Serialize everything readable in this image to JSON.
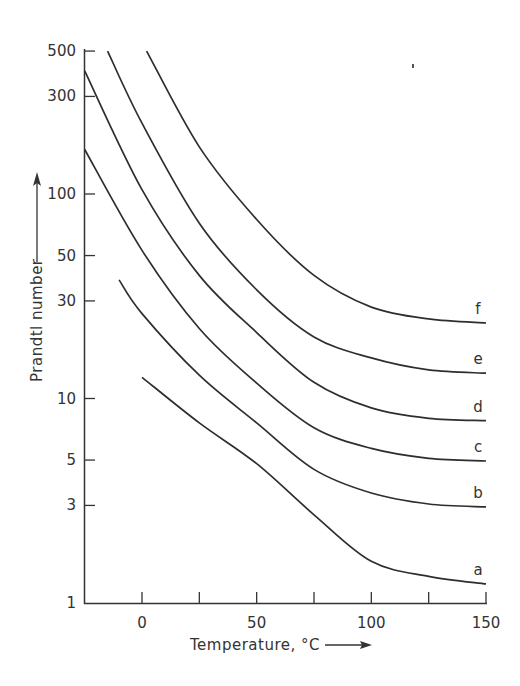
{
  "chart_data": {
    "type": "line",
    "title": "",
    "xlabel": "Temperature, °C",
    "ylabel": "Prandtl number",
    "x_scale": "linear",
    "y_scale": "log",
    "xlim": [
      -25,
      150
    ],
    "ylim": [
      1,
      500
    ],
    "x_ticks": [
      -25,
      0,
      25,
      50,
      75,
      100,
      125,
      150
    ],
    "x_tick_labels": [
      "0",
      "50",
      "100",
      "150"
    ],
    "x_tick_label_values": [
      0,
      50,
      100,
      150
    ],
    "y_ticks": [
      1,
      3,
      5,
      10,
      30,
      50,
      100,
      300,
      500
    ],
    "y_tick_labels": [
      "1",
      "3",
      "5",
      "10",
      "30",
      "50",
      "100",
      "300",
      "500"
    ],
    "grid": false,
    "legend": "inline labels at right end of curves",
    "series": [
      {
        "name": "a",
        "x": [
          0,
          25,
          50,
          75,
          100,
          125,
          150
        ],
        "values": [
          12.7,
          7.6,
          4.8,
          2.7,
          1.6,
          1.35,
          1.24
        ]
      },
      {
        "name": "b",
        "x": [
          -10,
          0,
          25,
          50,
          75,
          100,
          125,
          150
        ],
        "values": [
          38,
          26,
          13,
          7.6,
          4.5,
          3.45,
          3.05,
          2.95
        ]
      },
      {
        "name": "c",
        "x": [
          -25,
          0,
          25,
          50,
          75,
          100,
          125,
          150
        ],
        "values": [
          165,
          53,
          22,
          11.9,
          7.2,
          5.7,
          5.1,
          4.95
        ]
      },
      {
        "name": "d",
        "x": [
          -25,
          0,
          25,
          50,
          75,
          100,
          125,
          150
        ],
        "values": [
          400,
          105,
          40,
          21,
          12,
          9.0,
          8.0,
          7.8
        ]
      },
      {
        "name": "e",
        "x": [
          -15,
          0,
          25,
          50,
          75,
          100,
          125,
          150
        ],
        "values": [
          500,
          222,
          72,
          34,
          20,
          15.8,
          13.8,
          13.3
        ]
      },
      {
        "name": "f",
        "x": [
          2,
          25,
          50,
          75,
          100,
          125,
          150
        ],
        "values": [
          500,
          170,
          75,
          40,
          28,
          24.5,
          23.4
        ]
      }
    ],
    "annotations": [
      "x-axis arrow →",
      "y-axis arrow ↑"
    ]
  }
}
